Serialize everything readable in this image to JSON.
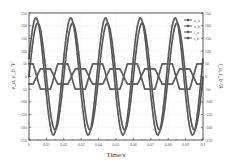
{
  "chart_data": {
    "type": "line",
    "title": "",
    "xlabel": "Time/s",
    "ylabel_left": "e_a, e_b /V",
    "ylabel_right": "i_a, i_b /A",
    "xlim": [
      0,
      0.1
    ],
    "ylim": [
      -250,
      250
    ],
    "ylim_right": [
      -250,
      250
    ],
    "x_ticks": [
      "0",
      "0.01",
      "0.02",
      "0.03",
      "0.04",
      "0.05",
      "0.06",
      "0.07",
      "0.08",
      "0.09",
      "0.1"
    ],
    "y_ticks": [
      "250",
      "200",
      "150",
      "100",
      "50",
      "0",
      "-50",
      "-100",
      "-150",
      "-200",
      "-250"
    ],
    "y_ticks_right": [
      "250",
      "200",
      "150",
      "100",
      "50",
      "0",
      "-50",
      "-100",
      "-150",
      "-200",
      "-250"
    ],
    "grid": true,
    "legend_position": "upper right",
    "series": [
      {
        "name": "e_a",
        "axis": "left",
        "shape": "sine",
        "amplitude": 230,
        "frequency_hz": 50,
        "phase_deg": 0,
        "offset": 0
      },
      {
        "name": "e_b",
        "axis": "left",
        "shape": "sine",
        "amplitude": 210,
        "frequency_hz": 50,
        "phase_deg": -18,
        "offset": 0
      },
      {
        "name": "i_a",
        "axis": "right",
        "shape": "trapezoid",
        "amplitude": 50,
        "frequency_hz": 50,
        "phase_deg": 100,
        "offset": 0
      },
      {
        "name": "i_b",
        "axis": "right",
        "shape": "trapezoid",
        "amplitude": 30,
        "frequency_hz": 50,
        "phase_deg": -80,
        "offset": 0
      }
    ],
    "colors": {
      "line": "#555555",
      "marker": "#666666",
      "grid": "#dddddd",
      "frame": "#333333"
    }
  }
}
